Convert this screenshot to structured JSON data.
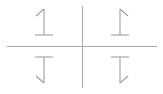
{
  "figure": {
    "background_color": "#ffffff",
    "width": 163,
    "height": 94,
    "axes": {
      "line_color": "#a9a9a9",
      "line_width": 1,
      "horizontal": {
        "x1": 7,
        "y1": 46,
        "x2": 157,
        "y2": 46
      },
      "vertical": {
        "x1": 82,
        "y1": 6,
        "x2": 82,
        "y2": 88
      },
      "center_x": 82,
      "center_y": 46
    },
    "glyph": {
      "character": "1",
      "stroke_color": "#9a9a9a",
      "stroke_width": 1.05
    },
    "quadrants": [
      {
        "name": "top-left",
        "label": "1",
        "transform": "none",
        "orientation": "upright",
        "center_x": 44,
        "center_y": 24
      },
      {
        "name": "top-right",
        "label": "1",
        "transform": "flip-horizontal",
        "orientation": "mirrored-horizontally",
        "center_x": 120,
        "center_y": 24
      },
      {
        "name": "bottom-left",
        "label": "1",
        "transform": "flip-vertical",
        "orientation": "mirrored-vertically",
        "center_x": 44,
        "center_y": 68
      },
      {
        "name": "bottom-right",
        "label": "1",
        "transform": "rotate-180",
        "orientation": "rotated-180",
        "center_x": 120,
        "center_y": 68
      }
    ]
  }
}
